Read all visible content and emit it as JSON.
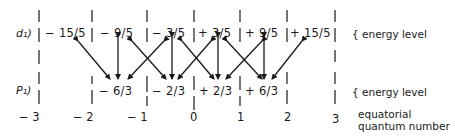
{
  "rows": {
    "upper": {
      "label": "d₁)",
      "values": [
        "− 15/5",
        "− 9/5",
        "− 3/5",
        "+ 3/5",
        "+ 9/5",
        "+ 15/5"
      ],
      "note": "{ energy level"
    },
    "lower": {
      "label": "P₁)",
      "values": [
        "− 6/3",
        "− 2/3",
        "+ 2/3",
        "+ 6/3"
      ],
      "note": "{ energy level"
    }
  },
  "axis": {
    "numbers": [
      "− 3",
      "− 2",
      "− 1",
      "0",
      "1",
      "2",
      "3"
    ],
    "caption_line1": "equatorial",
    "caption_line2": "quantum number"
  }
}
